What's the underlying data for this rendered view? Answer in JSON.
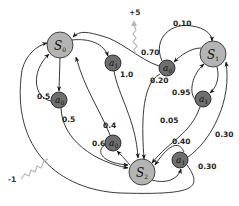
{
  "diagram": {
    "type": "markov-decision-process",
    "states": [
      {
        "id": "S0",
        "label": "S",
        "sub": "0"
      },
      {
        "id": "S1",
        "label": "S",
        "sub": "1"
      },
      {
        "id": "S2",
        "label": "S",
        "sub": "2"
      }
    ],
    "actions": [
      {
        "id": "S0_a0",
        "label": "a",
        "sub": "0"
      },
      {
        "id": "S0_a1",
        "label": "a",
        "sub": "1"
      },
      {
        "id": "S1_a0",
        "label": "a",
        "sub": "0"
      },
      {
        "id": "S1_a1",
        "label": "a",
        "sub": "1"
      },
      {
        "id": "S2_a0",
        "label": "a",
        "sub": "0"
      },
      {
        "id": "S2_a1",
        "label": "a",
        "sub": "1"
      }
    ],
    "transitions": {
      "S0_a0_to_S0": "0.5",
      "S0_a0_to_S2": "0.5",
      "S0_a1_to_S2": "1.0",
      "S1_a0_to_S0": "0.70",
      "S1_a0_to_S1": "0.10",
      "S1_a0_to_S2": "0.20",
      "S1_a1_to_S1": "0.95",
      "S1_a1_to_S2": "0.05",
      "S2_a0_to_S0": "0.4",
      "S2_a0_to_S2": "0.6",
      "S2_a1_to_S2": "0.40",
      "S2_a1_to_S1": "0.30",
      "S2_a1_to_S0": "0.30"
    },
    "rewards": {
      "positive": "+5",
      "negative": "-1"
    }
  }
}
